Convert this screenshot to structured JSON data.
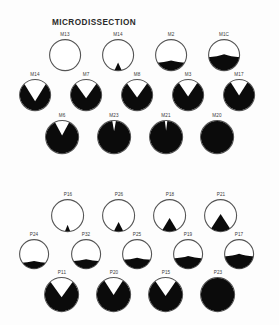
{
  "figure": {
    "title_microdissection": "MICRODISSECTION",
    "title_plating": "PLATING",
    "background_color": "#fdfdfd",
    "fill_color": "#0b0b0b",
    "outline_color": "#555555"
  },
  "chart_data": {
    "type": "pie",
    "subtitle": "",
    "xlabel": "",
    "ylabel": "",
    "legend_position": "none",
    "grid": false,
    "panels": [
      {
        "name": "MICRODISSECTION",
        "rows": [
          {
            "row_index": 1,
            "items": [
              {
                "label": "M13",
                "fraction": 0.0,
                "glyph": "empty"
              },
              {
                "label": "M14",
                "fraction": 0.04,
                "glyph": "wedge"
              },
              {
                "label": "M2",
                "fraction": 0.28,
                "glyph": "bottom"
              },
              {
                "label": "M1C",
                "fraction": 0.47,
                "glyph": "bottom"
              }
            ]
          },
          {
            "row_index": 2,
            "items": [
              {
                "label": "M14",
                "fraction": 0.72,
                "glyph": "notch"
              },
              {
                "label": "M7",
                "fraction": 0.78,
                "glyph": "notch"
              },
              {
                "label": "M8",
                "fraction": 0.8,
                "glyph": "notch"
              },
              {
                "label": "M3",
                "fraction": 0.82,
                "glyph": "notch"
              },
              {
                "label": "M17",
                "fraction": 0.84,
                "glyph": "notch"
              }
            ]
          },
          {
            "row_index": 3,
            "items": [
              {
                "label": "M6",
                "fraction": 0.88,
                "glyph": "notch"
              },
              {
                "label": "M23",
                "fraction": 0.97,
                "glyph": "notch"
              },
              {
                "label": "M21",
                "fraction": 0.98,
                "glyph": "notch"
              },
              {
                "label": "M20",
                "fraction": 1.0,
                "glyph": "full"
              }
            ]
          }
        ]
      },
      {
        "name": "PLATING",
        "rows": [
          {
            "row_index": 1,
            "items": [
              {
                "label": "P16",
                "fraction": 0.02,
                "glyph": "wedge"
              },
              {
                "label": "P26",
                "fraction": 0.06,
                "glyph": "wedge"
              },
              {
                "label": "P18",
                "fraction": 0.12,
                "glyph": "wedge"
              },
              {
                "label": "P21",
                "fraction": 0.18,
                "glyph": "wedge"
              }
            ]
          },
          {
            "row_index": 2,
            "items": [
              {
                "label": "P24",
                "fraction": 0.22,
                "glyph": "bottom"
              },
              {
                "label": "P32",
                "fraction": 0.28,
                "glyph": "bottom"
              },
              {
                "label": "P25",
                "fraction": 0.33,
                "glyph": "bottom"
              },
              {
                "label": "P19",
                "fraction": 0.38,
                "glyph": "bottom"
              },
              {
                "label": "P17",
                "fraction": 0.45,
                "glyph": "bottom"
              }
            ]
          },
          {
            "row_index": 3,
            "items": [
              {
                "label": "P11",
                "fraction": 0.8,
                "glyph": "notch"
              },
              {
                "label": "P20",
                "fraction": 0.84,
                "glyph": "notch"
              },
              {
                "label": "P15",
                "fraction": 0.82,
                "glyph": "notch"
              },
              {
                "label": "P23",
                "fraction": 1.0,
                "glyph": "full"
              }
            ]
          }
        ]
      }
    ]
  }
}
